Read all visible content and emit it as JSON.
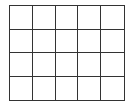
{
  "grid": {
    "columns": 5,
    "rows": 4,
    "line_color": "#333333",
    "fill_color": "#ffffff"
  }
}
